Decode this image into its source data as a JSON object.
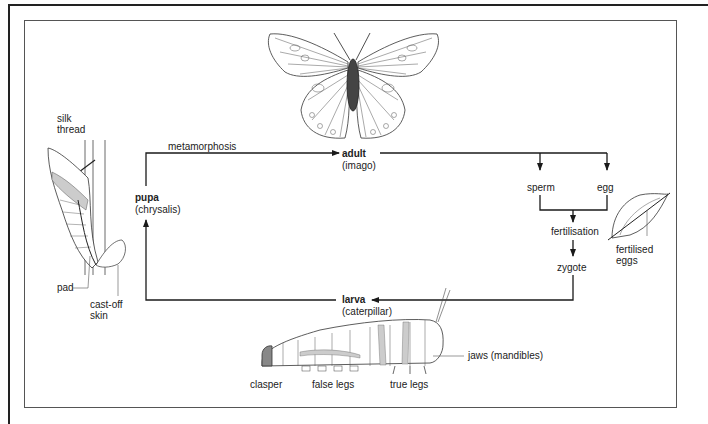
{
  "diagram": {
    "stages": {
      "adult": {
        "name": "adult",
        "alt": "(imago)"
      },
      "pupa": {
        "name": "pupa",
        "alt": "(chrysalis)"
      },
      "larva": {
        "name": "larva",
        "alt": "(caterpillar)"
      }
    },
    "flow": {
      "metamorphosis": "metamorphosis",
      "sperm": "sperm",
      "egg": "egg",
      "fertilisation": "fertilisation",
      "zygote": "zygote"
    },
    "pupa_labels": {
      "silk_thread_1": "silk",
      "silk_thread_2": "thread",
      "pad": "pad",
      "cast_off_1": "cast-off",
      "cast_off_2": "skin"
    },
    "egg_labels": {
      "fertilised_1": "fertilised",
      "fertilised_2": "eggs"
    },
    "larva_labels": {
      "clasper": "clasper",
      "false_legs": "false legs",
      "true_legs": "true legs",
      "jaws": "jaws (mandibles)"
    },
    "colors": {
      "line": "#1a1a1a",
      "frame": "#555555",
      "shade": "#bbbbbb"
    }
  }
}
